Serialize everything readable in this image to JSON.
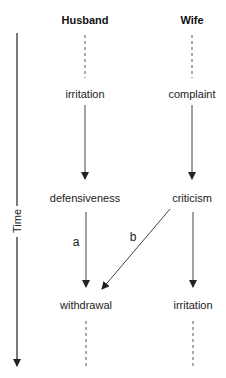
{
  "diagram": {
    "columns": [
      {
        "id": "husband",
        "title": "Husband"
      },
      {
        "id": "wife",
        "title": "Wife"
      }
    ],
    "time_axis_label": "Time",
    "nodes": [
      {
        "id": "h1",
        "column": "husband",
        "row": 0,
        "label": "irritation"
      },
      {
        "id": "h2",
        "column": "husband",
        "row": 1,
        "label": "defensiveness"
      },
      {
        "id": "h3",
        "column": "husband",
        "row": 2,
        "label": "withdrawal"
      },
      {
        "id": "w1",
        "column": "wife",
        "row": 0,
        "label": "complaint"
      },
      {
        "id": "w2",
        "column": "wife",
        "row": 1,
        "label": "criticism"
      },
      {
        "id": "w3",
        "column": "wife",
        "row": 2,
        "label": "irritation"
      }
    ],
    "edges": [
      {
        "from": "h1",
        "to": "h2",
        "label": ""
      },
      {
        "from": "h2",
        "to": "h3",
        "label": "a"
      },
      {
        "from": "w1",
        "to": "w2",
        "label": ""
      },
      {
        "from": "w2",
        "to": "w3",
        "label": ""
      },
      {
        "from": "w2",
        "to": "h3",
        "label": "b"
      }
    ],
    "continuation": "dashed lines above first and below last row indicate ongoing sequence"
  }
}
